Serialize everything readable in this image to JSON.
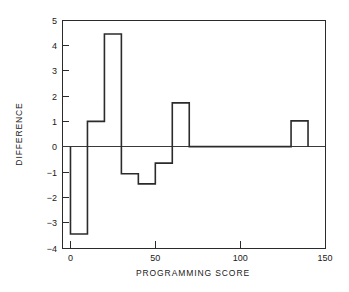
{
  "chart_data": {
    "type": "bar",
    "title": "",
    "subtitle": "",
    "xlabel": "PROGRAMMING SCORE",
    "ylabel": "DIFFERENCE",
    "xlim": [
      -5,
      150
    ],
    "ylim": [
      -4,
      5
    ],
    "xticks": [
      0,
      50,
      100,
      150
    ],
    "xtick_labels": [
      "0",
      "50",
      "100",
      "150"
    ],
    "yticks": [
      -4,
      -3,
      -2,
      -1,
      0,
      1,
      2,
      3,
      4,
      5
    ],
    "ytick_labels": [
      "−4",
      "−3",
      "−2",
      "−1",
      "0",
      "1",
      "2",
      "3",
      "4",
      "5"
    ],
    "grid": false,
    "legend": null,
    "zero_reference_line": 0,
    "bin_width": 10,
    "bin_edges": [
      0,
      10,
      20,
      30,
      40,
      50,
      60,
      70,
      130,
      140
    ],
    "bins": [
      {
        "x_start": 0,
        "x_end": 10,
        "value": -3.45
      },
      {
        "x_start": 10,
        "x_end": 20,
        "value": 1.0
      },
      {
        "x_start": 20,
        "x_end": 30,
        "value": 4.45
      },
      {
        "x_start": 30,
        "x_end": 40,
        "value": -1.07
      },
      {
        "x_start": 40,
        "x_end": 50,
        "value": -1.47
      },
      {
        "x_start": 50,
        "x_end": 60,
        "value": -0.65
      },
      {
        "x_start": 60,
        "x_end": 70,
        "value": 1.73
      },
      {
        "x_start": 130,
        "x_end": 140,
        "value": 1.02
      }
    ],
    "categories": [
      "0-10",
      "10-20",
      "20-30",
      "30-40",
      "40-50",
      "50-60",
      "60-70",
      "130-140"
    ],
    "values": [
      -3.45,
      1.0,
      4.45,
      -1.07,
      -1.47,
      -0.65,
      1.73,
      1.02
    ],
    "colors": {
      "line": "#2b2b2b",
      "axis": "#2b2b2b",
      "background": "#ffffff"
    }
  }
}
